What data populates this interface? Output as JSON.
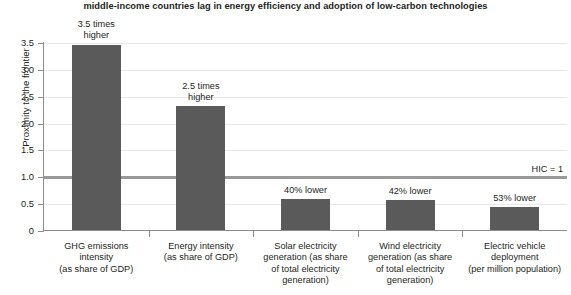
{
  "chart_data": {
    "type": "bar",
    "title": "middle-income countries lag in energy efficiency and adoption of low-carbon technologies",
    "xlabel": "",
    "ylabel": "Proximity to the frontier",
    "ylim": [
      0,
      3.5
    ],
    "grid": true,
    "legend": null,
    "categories": [
      "GHG emissions intensity (as share of GDP)",
      "Energy intensity (as share of GDP)",
      "Solar electricity generation (as share of total electricity generation)",
      "Wind electricity generation (as share of total electricity generation)",
      "Electric vehicle deployment (per million population)"
    ],
    "values": [
      3.47,
      2.32,
      0.6,
      0.57,
      0.45
    ],
    "bar_labels": [
      "3.5 times higher",
      "2.5 times higher",
      "40% lower",
      "42% lower",
      "53% lower"
    ],
    "reference_line": {
      "value": 1.0,
      "label": "HIC = 1"
    },
    "y_ticks": [
      "0",
      "0.5",
      "1.0",
      "1.5",
      "2.0",
      "2.5",
      "3.0",
      "3.5"
    ],
    "y_tick_values": [
      0,
      0.5,
      1.0,
      1.5,
      2.0,
      2.5,
      3.0,
      3.5
    ],
    "colors": {
      "bar": "#5a5a5a",
      "reference_line": "#9a9a9a",
      "grid": "#e8e8e8",
      "axis": "#8c8c8c",
      "text": "#231f20"
    }
  },
  "bar_label_lines": [
    [
      "3.5 times",
      "higher"
    ],
    [
      "2.5 times",
      "higher"
    ],
    [
      "40% lower"
    ],
    [
      "42% lower"
    ],
    [
      "53% lower"
    ]
  ],
  "category_label_lines": [
    [
      "GHG emissions",
      "intensity",
      "(as share of GDP)"
    ],
    [
      "Energy intensity",
      "(as share of GDP)"
    ],
    [
      "Solar electricity",
      "generation (as share",
      "of total electricity",
      "generation)"
    ],
    [
      "Wind electricity",
      "generation (as share",
      "of total electricity",
      "generation)"
    ],
    [
      "Electric vehicle",
      "deployment",
      "(per million population)"
    ]
  ]
}
